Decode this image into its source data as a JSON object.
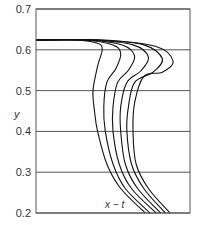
{
  "chart_data": {
    "type": "line",
    "title": "",
    "xlabel": "",
    "ylabel": "y",
    "ylim": [
      0.2,
      0.7
    ],
    "grid": "horizontal",
    "yticks": [
      "0.7",
      "0.6",
      "0.5",
      "0.4",
      "0.3",
      "0.2"
    ],
    "annotation": "x − t",
    "legend": null,
    "series": [
      {
        "name": "curve-1",
        "points": [
          [
            0.0,
            0.624
          ],
          [
            0.25,
            0.624
          ],
          [
            0.4,
            0.616
          ],
          [
            0.43,
            0.6
          ],
          [
            0.4,
            0.56
          ],
          [
            0.37,
            0.5
          ],
          [
            0.38,
            0.45
          ],
          [
            0.4,
            0.4
          ],
          [
            0.46,
            0.32
          ],
          [
            0.55,
            0.26
          ],
          [
            0.71,
            0.2
          ]
        ]
      },
      {
        "name": "curve-2",
        "points": [
          [
            0.0,
            0.624
          ],
          [
            0.3,
            0.624
          ],
          [
            0.5,
            0.612
          ],
          [
            0.55,
            0.59
          ],
          [
            0.52,
            0.555
          ],
          [
            0.46,
            0.52
          ],
          [
            0.44,
            0.46
          ],
          [
            0.45,
            0.4
          ],
          [
            0.5,
            0.32
          ],
          [
            0.58,
            0.26
          ],
          [
            0.74,
            0.2
          ]
        ]
      },
      {
        "name": "curve-3",
        "points": [
          [
            0.0,
            0.624
          ],
          [
            0.33,
            0.624
          ],
          [
            0.56,
            0.612
          ],
          [
            0.64,
            0.585
          ],
          [
            0.6,
            0.55
          ],
          [
            0.53,
            0.52
          ],
          [
            0.5,
            0.46
          ],
          [
            0.5,
            0.4
          ],
          [
            0.54,
            0.32
          ],
          [
            0.62,
            0.26
          ],
          [
            0.78,
            0.2
          ]
        ]
      },
      {
        "name": "curve-4",
        "points": [
          [
            0.0,
            0.624
          ],
          [
            0.36,
            0.624
          ],
          [
            0.63,
            0.612
          ],
          [
            0.73,
            0.582
          ],
          [
            0.68,
            0.548
          ],
          [
            0.59,
            0.52
          ],
          [
            0.55,
            0.46
          ],
          [
            0.55,
            0.4
          ],
          [
            0.58,
            0.32
          ],
          [
            0.66,
            0.26
          ],
          [
            0.81,
            0.2
          ]
        ]
      },
      {
        "name": "curve-5",
        "points": [
          [
            0.0,
            0.624
          ],
          [
            0.4,
            0.624
          ],
          [
            0.7,
            0.612
          ],
          [
            0.82,
            0.578
          ],
          [
            0.76,
            0.545
          ],
          [
            0.64,
            0.52
          ],
          [
            0.6,
            0.46
          ],
          [
            0.59,
            0.4
          ],
          [
            0.62,
            0.32
          ],
          [
            0.7,
            0.26
          ],
          [
            0.84,
            0.2
          ]
        ]
      },
      {
        "name": "curve-6",
        "points": [
          [
            0.0,
            0.624
          ],
          [
            0.44,
            0.624
          ],
          [
            0.78,
            0.608
          ],
          [
            0.89,
            0.572
          ],
          [
            0.82,
            0.545
          ],
          [
            0.7,
            0.535
          ],
          [
            0.64,
            0.47
          ],
          [
            0.63,
            0.4
          ],
          [
            0.65,
            0.32
          ],
          [
            0.73,
            0.26
          ],
          [
            0.87,
            0.2
          ]
        ]
      }
    ]
  },
  "colors": {
    "frame": "#555555",
    "grid": "#555555",
    "curve": "#111111",
    "text": "#333333"
  }
}
